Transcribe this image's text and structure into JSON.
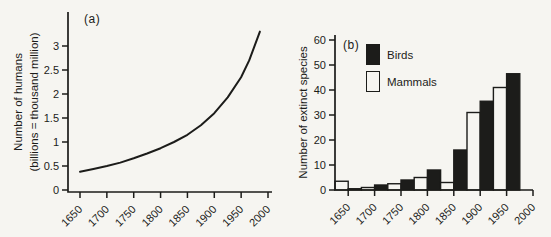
{
  "figure": {
    "background": "#f6f5f1",
    "ink": "#1c1c1a"
  },
  "panel_a": {
    "label": "(a)",
    "ylabel_line1": "Number of humans",
    "ylabel_line2": "(billions = thousand million)"
  },
  "panel_b": {
    "label": "(b)",
    "ylabel": "Number of extinct species",
    "legend": [
      {
        "label": "Birds",
        "fill": "#1c1c1a"
      },
      {
        "label": "Mammals",
        "fill": "#f6f5f1"
      }
    ]
  },
  "chart_data": [
    {
      "id": "population",
      "type": "line",
      "panel": "(a)",
      "title": "",
      "xlabel": "",
      "ylabel": "Number of humans (billions = thousand million)",
      "x": [
        1650,
        1675,
        1700,
        1725,
        1750,
        1775,
        1800,
        1825,
        1850,
        1875,
        1900,
        1925,
        1950,
        1965,
        1985
      ],
      "y": [
        0.38,
        0.44,
        0.5,
        0.57,
        0.66,
        0.76,
        0.87,
        1.0,
        1.15,
        1.35,
        1.6,
        1.93,
        2.35,
        2.7,
        3.3
      ],
      "x_ticks": [
        "1650",
        "1700",
        "1750",
        "1800",
        "1850",
        "1900",
        "1950",
        "2000"
      ],
      "y_ticks": [
        "0",
        "0.5",
        "1",
        "1.5",
        "2",
        "2.5",
        "3"
      ],
      "xlim": [
        1650,
        2000
      ],
      "ylim": [
        0,
        3.7
      ],
      "grid": false,
      "line_color": "#1c1c1a"
    },
    {
      "id": "extinctions",
      "type": "bar",
      "panel": "(b)",
      "title": "",
      "xlabel": "",
      "ylabel": "Number of extinct species",
      "categories": [
        "1650",
        "1700",
        "1750",
        "1800",
        "1850",
        "1900",
        "1950"
      ],
      "series": [
        {
          "name": "Mammals",
          "fill": "#f6f5f1",
          "values": [
            3.5,
            1,
            2.5,
            5,
            3,
            31,
            41
          ]
        },
        {
          "name": "Birds",
          "fill": "#1c1c1a",
          "values": [
            0.5,
            2,
            4,
            8,
            16,
            35.5,
            46.5
          ]
        }
      ],
      "x_ticks": [
        "1650",
        "1700",
        "1750",
        "1800",
        "1850",
        "1900",
        "1950",
        "2000"
      ],
      "y_ticks": [
        "0",
        "10",
        "20",
        "30",
        "40",
        "50",
        "60"
      ],
      "ylim": [
        0,
        60
      ],
      "grid": false,
      "legend_position": "upper-left-inside",
      "bar_layout": "paired bars straddle each year tick: Mammals (white) left of tick, Birds (black) right of tick; empty half-slot before the 2000 tick"
    }
  ]
}
